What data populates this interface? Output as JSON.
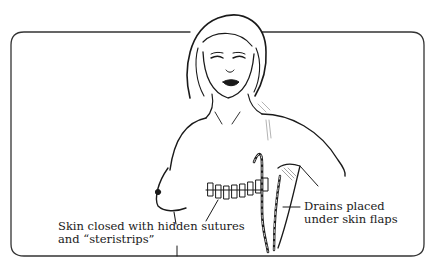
{
  "illustration": {
    "subject": "mastectomy wound closure with drains",
    "colors": {
      "ink": "#1a1a1a",
      "frame": "#333333",
      "background": "#ffffff"
    }
  },
  "labels": {
    "skin_closure": {
      "line1": "Skin closed with hidden sutures",
      "line2": "and “steristrips”"
    },
    "drains": {
      "line1": "Drains placed",
      "line2": "under skin flaps"
    }
  }
}
